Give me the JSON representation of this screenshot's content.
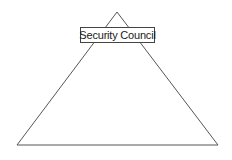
{
  "diagram": {
    "type": "pyramid",
    "label": "Security Council",
    "colors": {
      "stroke": "#555555",
      "background": "#ffffff",
      "text": "#1a1a1a"
    },
    "shape": {
      "apex": [
        117,
        12
      ],
      "base_left": [
        17,
        145
      ],
      "base_right": [
        218,
        145
      ]
    }
  }
}
